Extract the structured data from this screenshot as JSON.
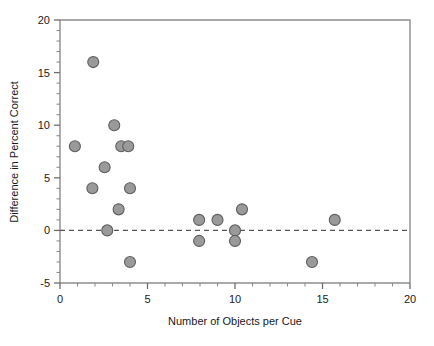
{
  "chart_data": {
    "type": "scatter",
    "title": "",
    "xlabel": "Number of Objects per Cue",
    "ylabel": "Difference in Percent Correct",
    "xlim": [
      0,
      20
    ],
    "ylim": [
      -5,
      20
    ],
    "x_ticks": [
      0,
      5,
      10,
      15,
      20
    ],
    "x_tick_labels": [
      "0",
      "5",
      "10",
      "15",
      "20"
    ],
    "x_minor_tick_step": 1,
    "y_ticks": [
      -5,
      0,
      5,
      10,
      15,
      20
    ],
    "y_tick_labels": [
      "-5",
      "0",
      "5",
      "10",
      "15",
      "20"
    ],
    "y_minor_tick_step": 1,
    "grid": false,
    "legend": null,
    "reference_lines": [
      {
        "axis": "y",
        "value": 0,
        "style": "dashed",
        "color": "#555555"
      }
    ],
    "marker": {
      "shape": "circle",
      "fill_color": "#9a9a9a",
      "edge_color": "#5e5e5e",
      "size_px": 11
    },
    "points": [
      {
        "x": 1.9,
        "y": 16
      },
      {
        "x": 3.1,
        "y": 10
      },
      {
        "x": 0.85,
        "y": 8
      },
      {
        "x": 3.5,
        "y": 8
      },
      {
        "x": 3.9,
        "y": 8
      },
      {
        "x": 2.55,
        "y": 6
      },
      {
        "x": 1.85,
        "y": 4
      },
      {
        "x": 4.0,
        "y": 4
      },
      {
        "x": 3.35,
        "y": 2
      },
      {
        "x": 2.7,
        "y": 0
      },
      {
        "x": 4.0,
        "y": -3
      },
      {
        "x": 7.95,
        "y": 1
      },
      {
        "x": 7.95,
        "y": -1
      },
      {
        "x": 9.0,
        "y": 1
      },
      {
        "x": 10.4,
        "y": 2
      },
      {
        "x": 10.0,
        "y": 0
      },
      {
        "x": 10.0,
        "y": -1
      },
      {
        "x": 14.4,
        "y": -3
      },
      {
        "x": 15.7,
        "y": 1
      }
    ]
  }
}
